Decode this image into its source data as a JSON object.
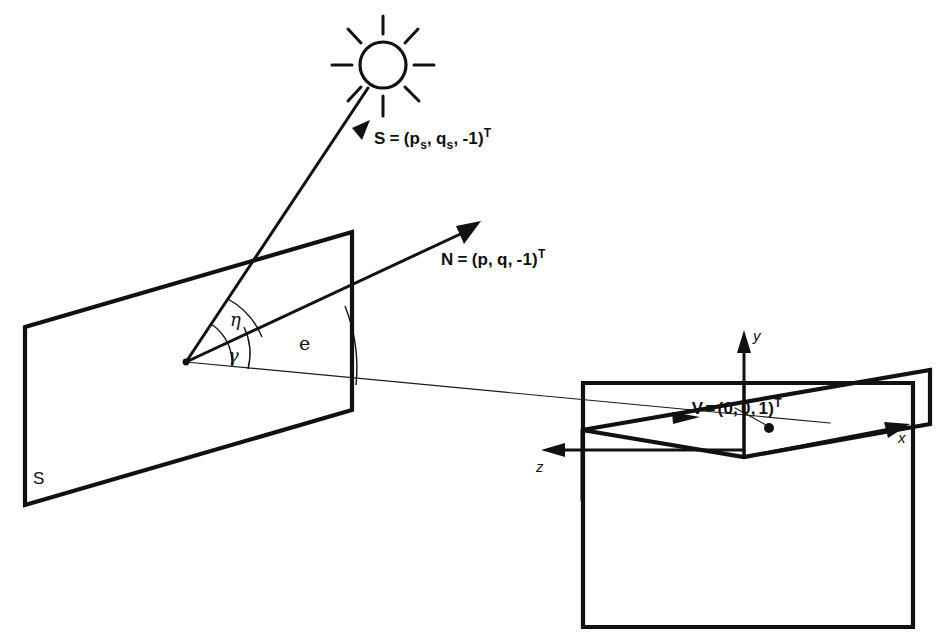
{
  "figure": {
    "background_color": "#ffffff",
    "line_color": "#111111",
    "labels": {
      "source_vector": {
        "symbol": "S",
        "equals": "=",
        "open": "(",
        "comp1_base": "p",
        "comp1_sub": "s",
        "sep1": ",",
        "comp2_base": "q",
        "comp2_sub": "s",
        "sep2": ",",
        "comp3": "-1",
        "close": ")",
        "superscript": "T",
        "full_text": "S = (p_s, q_s, -1)^T"
      },
      "normal_vector": {
        "symbol": "N",
        "equals": "=",
        "open": "(",
        "comp1": "p",
        "sep1": ",",
        "comp2": "q",
        "sep2": ",",
        "comp3": "-1",
        "close": ")",
        "superscript": "T",
        "full_text": "N = (p, q, -1)^T"
      },
      "view_vector": {
        "symbol": "-V",
        "equals": "=",
        "open": "(",
        "comp1": "0",
        "sep1": ",",
        "comp2": "0",
        "sep2": ",",
        "comp3": "1",
        "close": ")",
        "superscript": "T",
        "full_text": "-V = (0, 0, 1)^T"
      },
      "angle_eta": "η",
      "angle_gamma": "γ",
      "angle_e": "e",
      "surface": "S",
      "axis_x": "x",
      "axis_y": "y",
      "axis_z": "z"
    },
    "elements": {
      "sun_icon": "sun-icon",
      "surface_plane": "surface-patch-parallelogram",
      "image_plane": "image-plane-parallelogram",
      "ground_plane": "ground-plane-parallelogram",
      "vertex": "surface-point-vertex"
    }
  }
}
